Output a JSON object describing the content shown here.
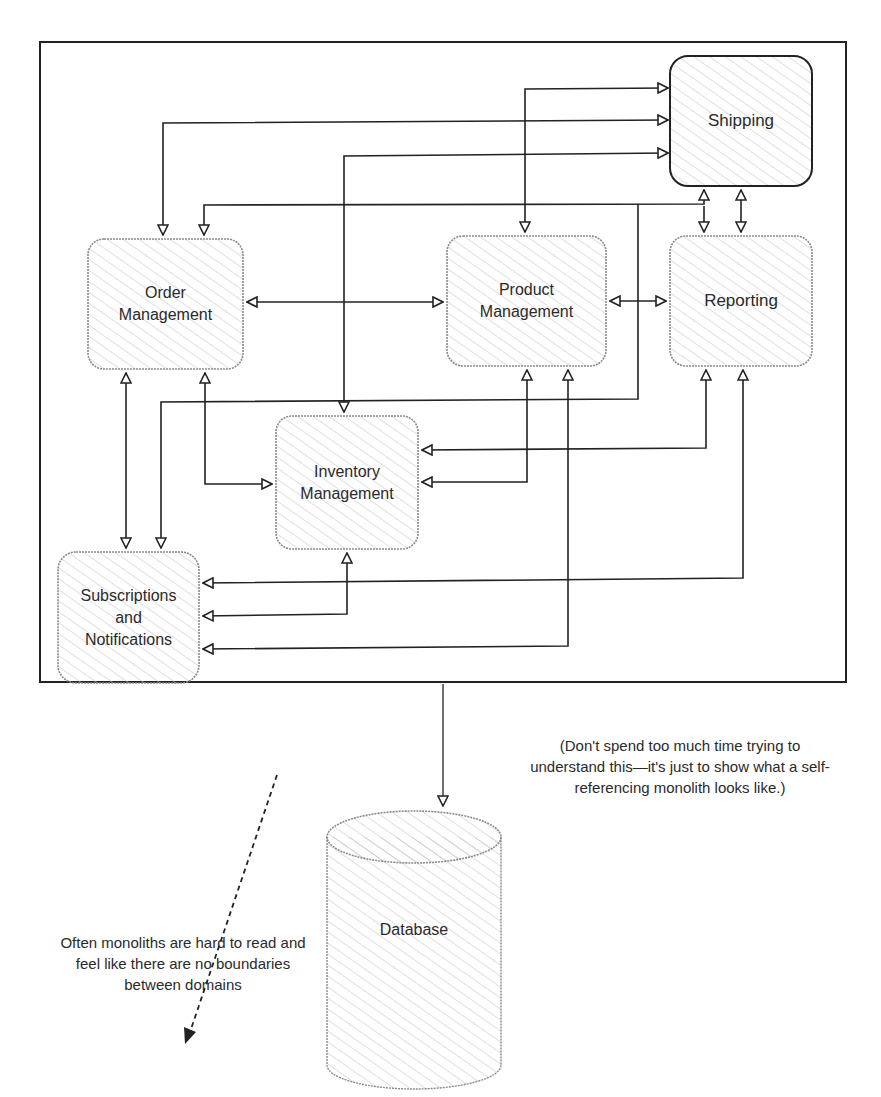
{
  "diagram": {
    "title": "Self-referencing monolith",
    "boxes": {
      "shipping": {
        "label": "Shipping"
      },
      "order_management": {
        "label": "Order\nManagement"
      },
      "product_management": {
        "label": "Product\nManagement"
      },
      "reporting": {
        "label": "Reporting"
      },
      "inventory_management": {
        "label": "Inventory\nManagement"
      },
      "subscriptions_notifications": {
        "label": "Subscriptions\nand\nNotifications"
      },
      "database": {
        "label": "Database"
      }
    },
    "notes": {
      "aside": "(Don't spend too much time trying to understand this—it's just to show what a self-referencing monolith looks like.)",
      "caption": "Often monoliths are hard to read and feel like there are no boundaries between domains"
    },
    "colors": {
      "stroke": "#222222",
      "hatch": "#bdbdbd",
      "box_border": "#8a8a8a"
    }
  }
}
